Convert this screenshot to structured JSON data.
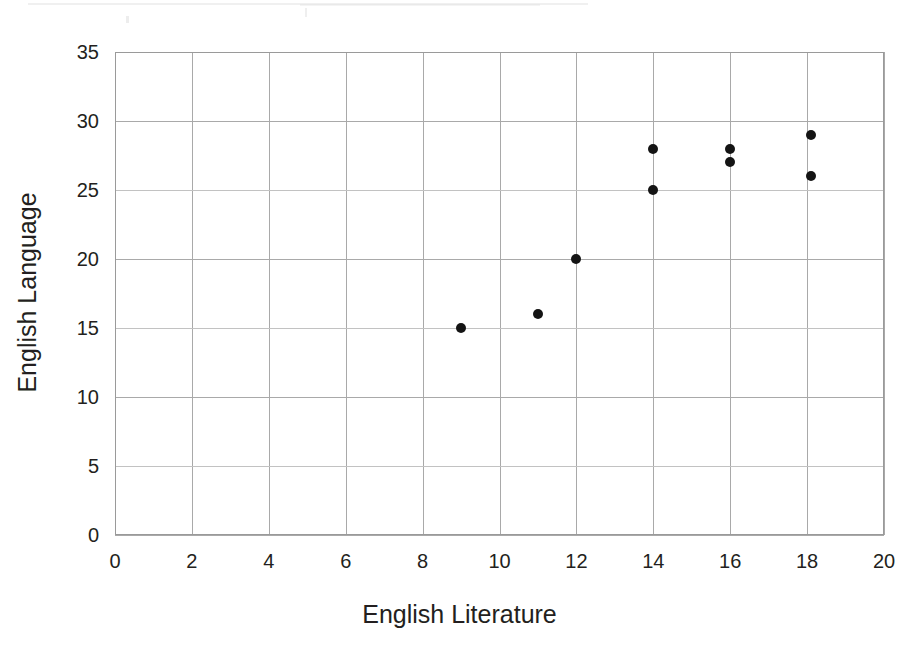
{
  "chart_data": {
    "type": "scatter",
    "title": "",
    "xlabel": "English Literature",
    "ylabel": "English Language",
    "xlim": [
      0,
      20
    ],
    "ylim": [
      0,
      35
    ],
    "xticks": [
      0,
      2,
      4,
      6,
      8,
      10,
      12,
      14,
      16,
      18,
      20
    ],
    "yticks": [
      0,
      5,
      10,
      15,
      20,
      25,
      30,
      35
    ],
    "xtick_labels": [
      "0",
      "2",
      "4",
      "6",
      "8",
      "10",
      "12",
      "14",
      "16",
      "18",
      "20"
    ],
    "ytick_labels": [
      "0",
      "5",
      "10",
      "15",
      "20",
      "25",
      "30",
      "35"
    ],
    "grid": true,
    "grid_x_step": 2,
    "grid_y_step": 5,
    "legend": "none",
    "marker": "filled-circle",
    "marker_color": "#141414",
    "grid_color": "#a9a9a9",
    "series": [
      {
        "name": "students",
        "points": [
          {
            "x": 9,
            "y": 15
          },
          {
            "x": 11,
            "y": 16
          },
          {
            "x": 12,
            "y": 20
          },
          {
            "x": 14,
            "y": 25
          },
          {
            "x": 14,
            "y": 28
          },
          {
            "x": 16,
            "y": 27
          },
          {
            "x": 16,
            "y": 28
          },
          {
            "x": 18.1,
            "y": 26
          },
          {
            "x": 18.1,
            "y": 29
          }
        ]
      }
    ]
  }
}
